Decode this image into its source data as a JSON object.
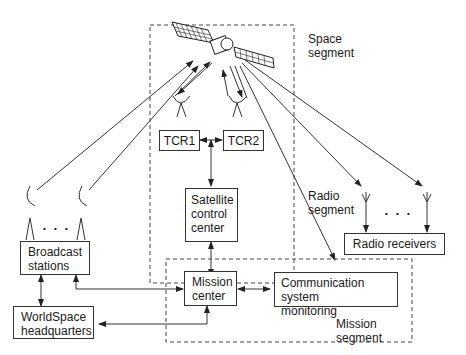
{
  "diagram": {
    "segments": {
      "space": {
        "line1": "Space",
        "line2": "segment"
      },
      "radio": {
        "line1": "Radio",
        "line2": "segment"
      },
      "mission": {
        "line1": "Mission",
        "line2": "segment"
      }
    },
    "nodes": {
      "tcr1": {
        "label": "TCR1"
      },
      "tcr2": {
        "label": "TCR2"
      },
      "scc": {
        "line1": "Satellite",
        "line2": "control",
        "line3": "center"
      },
      "broadcast": {
        "line1": "Broadcast",
        "line2": "stations"
      },
      "hq": {
        "line1": "WorldSpace",
        "line2": "headquarters"
      },
      "mission_center": {
        "line1": "Mission",
        "line2": "center"
      },
      "csm": {
        "line1": "Communication system",
        "line2": "monitoring"
      },
      "radio_receivers": {
        "label": "Radio receivers"
      }
    },
    "ellipsis": "• • •",
    "colors": {
      "line": "#333333",
      "background": "#ffffff"
    }
  }
}
